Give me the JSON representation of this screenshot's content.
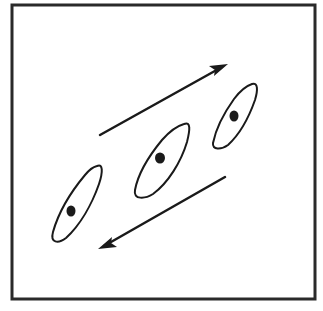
{
  "diagram": {
    "colors": {
      "background": "#ffffff",
      "stroke": "#1a1a1a",
      "frame": "#2a2a2a"
    },
    "frame": {
      "x": 12,
      "y": 5,
      "width": 303,
      "height": 294
    },
    "cells": [
      {
        "id": "cell-left",
        "cx": 78,
        "cy": 203,
        "rx": 13,
        "ry": 42,
        "rotate": 28,
        "nucleus": {
          "cx": 71,
          "cy": 211,
          "r": 5
        }
      },
      {
        "id": "cell-middle",
        "cx": 162,
        "cy": 160,
        "rx": 15,
        "ry": 41,
        "rotate": 30,
        "nucleus": {
          "cx": 160,
          "cy": 158,
          "r": 5
        }
      },
      {
        "id": "cell-right",
        "cx": 235,
        "cy": 117,
        "rx": 12,
        "ry": 36,
        "rotate": 30,
        "nucleus": {
          "cx": 234,
          "cy": 116,
          "r": 5
        }
      }
    ],
    "arrows": [
      {
        "id": "arrow-up-right",
        "direction": "up-right",
        "x1": 100,
        "y1": 135,
        "x2": 228,
        "y2": 64
      },
      {
        "id": "arrow-down-left",
        "direction": "down-left",
        "x1": 225,
        "y1": 177,
        "x2": 98,
        "y2": 249
      }
    ]
  }
}
